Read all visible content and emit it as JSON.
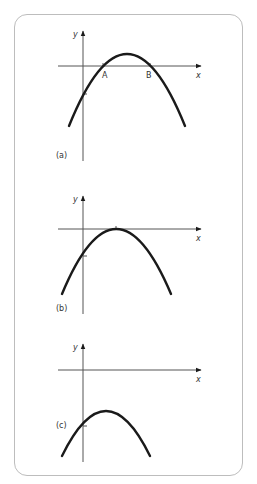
{
  "diagram": {
    "colors": {
      "frame": "#bdbdbd",
      "curve": "#1a1a1a",
      "axis": "#555555"
    },
    "panels": [
      {
        "id": "a",
        "label": "(a)",
        "y_axis_label": "y",
        "x_axis_label": "x",
        "points": {
          "A": "A",
          "B": "B"
        },
        "description": "Downward parabola crossing x-axis at two points A and B; vertex above x-axis"
      },
      {
        "id": "b",
        "label": "(b)",
        "y_axis_label": "y",
        "x_axis_label": "x",
        "description": "Downward parabola touching x-axis at its vertex (one repeated root)"
      },
      {
        "id": "c",
        "label": "(c)",
        "y_axis_label": "y",
        "x_axis_label": "x",
        "description": "Downward parabola entirely below x-axis (no real roots)"
      }
    ]
  }
}
